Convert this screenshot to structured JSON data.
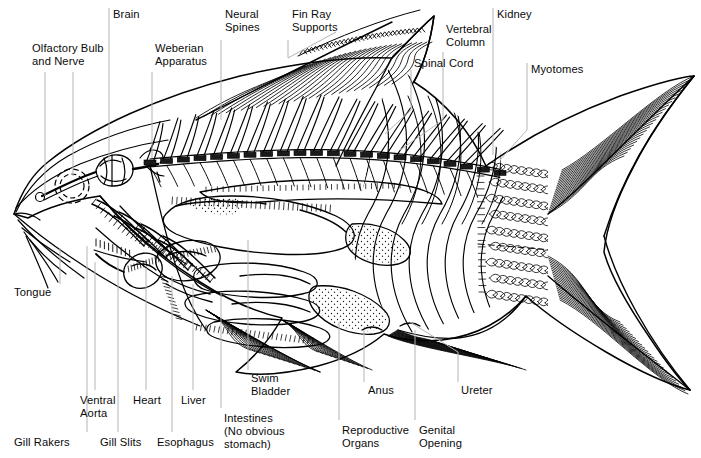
{
  "diagram": {
    "background_color": "#ffffff",
    "line_color": "#000000",
    "leader_line_color": "#b4b4b4",
    "text_color": "#0a0a0a"
  },
  "labels": [
    {
      "id": "brain",
      "text": "Brain",
      "x": 113,
      "y": 8,
      "align": "left"
    },
    {
      "id": "neural_spines",
      "text": "Neural\nSpines",
      "x": 225,
      "y": 8,
      "align": "left"
    },
    {
      "id": "fin_ray_supports",
      "text": "Fin Ray\nSupports",
      "x": 292,
      "y": 8,
      "align": "left"
    },
    {
      "id": "kidney",
      "text": "Kidney",
      "x": 497,
      "y": 8,
      "align": "left"
    },
    {
      "id": "olfactory_bulb",
      "text": "Olfactory Bulb\nand Nerve",
      "x": 32,
      "y": 42,
      "align": "left"
    },
    {
      "id": "weberian",
      "text": "Weberian\nApparatus",
      "x": 155,
      "y": 42,
      "align": "left"
    },
    {
      "id": "vertebral_column",
      "text": "Vertebral\nColumn",
      "x": 446,
      "y": 23,
      "align": "left"
    },
    {
      "id": "spinal_cord",
      "text": "Spinal Cord",
      "x": 414,
      "y": 57,
      "align": "left"
    },
    {
      "id": "myotomes",
      "text": "Myotomes",
      "x": 531,
      "y": 63,
      "align": "left"
    },
    {
      "id": "tongue",
      "text": "Tongue",
      "x": 14,
      "y": 286,
      "align": "left"
    },
    {
      "id": "swim_bladder",
      "text": "Swim\nBladder",
      "x": 251,
      "y": 372,
      "align": "left"
    },
    {
      "id": "anus",
      "text": "Anus",
      "x": 368,
      "y": 384,
      "align": "left"
    },
    {
      "id": "ureter",
      "text": "Ureter",
      "x": 461,
      "y": 384,
      "align": "left"
    },
    {
      "id": "ventral_aorta",
      "text": "Ventral\nAorta",
      "x": 80,
      "y": 394,
      "align": "left"
    },
    {
      "id": "heart",
      "text": "Heart",
      "x": 133,
      "y": 394,
      "align": "left"
    },
    {
      "id": "liver",
      "text": "Liver",
      "x": 181,
      "y": 394,
      "align": "left"
    },
    {
      "id": "intestines",
      "text": "Intestines\n(No obvious\nstomach)",
      "x": 224,
      "y": 412,
      "align": "left"
    },
    {
      "id": "reproductive",
      "text": "Reproductive\nOrgans",
      "x": 342,
      "y": 424,
      "align": "left"
    },
    {
      "id": "genital_opening",
      "text": "Genital\nOpening",
      "x": 419,
      "y": 424,
      "align": "left"
    },
    {
      "id": "gill_rakers",
      "text": "Gill Rakers",
      "x": 14,
      "y": 436,
      "align": "left"
    },
    {
      "id": "gill_slits",
      "text": "Gill Slits",
      "x": 100,
      "y": 436,
      "align": "left"
    },
    {
      "id": "esophagus",
      "text": "Esophagus",
      "x": 157,
      "y": 436,
      "align": "left"
    }
  ],
  "leader_lines": [
    {
      "id": "lead-olfactory-a",
      "for": "olfactory_bulb",
      "d": "M 45 72 L 45 196"
    },
    {
      "id": "lead-olfactory-b",
      "for": "olfactory_bulb",
      "d": "M 73 72 L 73 176"
    },
    {
      "id": "lead-brain",
      "for": "brain",
      "d": "M 109 8 L 109 163"
    },
    {
      "id": "lead-weberian",
      "for": "weberian",
      "d": "M 152 72 L 152 158"
    },
    {
      "id": "lead-neural",
      "for": "neural_spines",
      "d": "M 221 40 L 221 120"
    },
    {
      "id": "lead-finray",
      "for": "fin_ray_supports",
      "d": "M 288 40 L 288 58 L 336 32"
    },
    {
      "id": "lead-vertebral",
      "for": "vertebral_column",
      "d": "M 443 52 L 443 120 L 400 150"
    },
    {
      "id": "lead-spinal",
      "for": "spinal_cord",
      "d": "M 411 70 L 411 110 L 385 134"
    },
    {
      "id": "lead-kidney",
      "for": "kidney",
      "d": "M 493 8 L 493 155"
    },
    {
      "id": "lead-myotomes",
      "for": "myotomes",
      "d": "M 527 63 L 527 130 L 500 160"
    },
    {
      "id": "lead-tongue",
      "for": "tongue",
      "d": "M 60 284 L 60 248"
    },
    {
      "id": "lead-gillrakers",
      "for": "gill_rakers",
      "d": "M 87 432 L 87 246"
    },
    {
      "id": "lead-ventralaorta",
      "for": "ventral_aorta",
      "d": "M 95 390 L 95 262"
    },
    {
      "id": "lead-gillslits",
      "for": "gill_slits",
      "d": "M 118 432 L 118 258"
    },
    {
      "id": "lead-heart",
      "for": "heart",
      "d": "M 146 390 L 146 268"
    },
    {
      "id": "lead-esophagus",
      "for": "esophagus",
      "d": "M 172 432 L 172 276"
    },
    {
      "id": "lead-liver",
      "for": "liver",
      "d": "M 193 390 L 193 284"
    },
    {
      "id": "lead-intestines",
      "for": "intestines",
      "d": "M 221 408 L 221 292"
    },
    {
      "id": "lead-swimbladder",
      "for": "swim_bladder",
      "d": "M 248 370 L 248 240"
    },
    {
      "id": "lead-reproductive",
      "for": "reproductive",
      "d": "M 339 420 L 339 322"
    },
    {
      "id": "lead-anus",
      "for": "anus",
      "d": "M 364 382 L 364 330"
    },
    {
      "id": "lead-genital",
      "for": "genital_opening",
      "d": "M 415 420 L 415 330"
    },
    {
      "id": "lead-ureter",
      "for": "ureter",
      "d": "M 458 382 L 458 352 L 410 322"
    }
  ],
  "artwork": {
    "body_outline": "M 14 214 C 20 196 30 176 48 162 C 90 128 160 96 240 76 C 300 62 350 56 392 58 C 404 46 418 30 434 16 C 430 44 424 64 414 82 C 446 102 472 134 486 166 C 520 142 566 116 620 96 C 660 82 686 76 694 76 C 678 96 652 130 634 166 C 616 200 606 230 604 252 C 610 274 628 306 650 338 C 666 362 680 380 690 390 C 672 386 640 372 606 352 C 572 332 544 312 526 296 C 506 320 476 336 442 340 C 420 342 400 340 384 334 C 370 346 348 358 318 366 C 286 374 256 376 236 372 C 256 356 272 336 282 318 C 256 312 228 300 200 282 C 156 254 122 222 100 196 C 72 200 46 208 28 218 Z",
    "head_dome": "M 16 212 C 26 190 44 170 68 156 C 100 138 138 126 170 120",
    "gill_cover": "M 100 196 C 118 218 140 240 166 260 C 186 276 206 288 222 296",
    "operculum_edge": "M 150 166 C 158 202 166 238 178 272 C 186 296 196 316 206 330",
    "jaw_line": "M 14 214 C 28 226 48 242 72 258 C 110 284 156 308 200 326",
    "lower_jaw": "M 18 220 C 34 238 56 258 84 278",
    "mouth": "M 14 214 C 22 212 32 214 40 220",
    "eye_cx": 72,
    "eye_cy": 186,
    "eye_r": 17,
    "brain_cx": 104,
    "brain_cy": 166,
    "vertebra_count": 22,
    "neural_spine_count": 20,
    "myotome_count": 9,
    "scale_rows": 9,
    "scale_cols": 9
  }
}
